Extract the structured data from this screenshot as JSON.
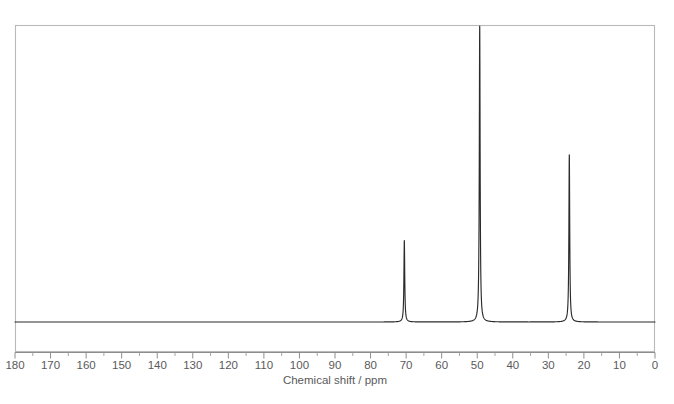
{
  "figure": {
    "title": "",
    "background_color": "#ffffff"
  },
  "chart_data": {
    "type": "line",
    "title": "",
    "subtitle": "",
    "xlabel": "Chemical shift / ppm",
    "ylabel": "",
    "xlim": [
      180,
      0
    ],
    "x_axis_reversed": true,
    "grid": false,
    "legend": null,
    "annotations": [],
    "x_major_ticks": [
      180,
      170,
      160,
      150,
      140,
      130,
      120,
      110,
      100,
      90,
      80,
      70,
      60,
      50,
      40,
      30,
      20,
      10,
      0
    ],
    "x_tick_labels": [
      "180",
      "170",
      "160",
      "150",
      "140",
      "130",
      "120",
      "110",
      "100",
      "90",
      "80",
      "70",
      "60",
      "50",
      "40",
      "30",
      "20",
      "10",
      "0"
    ],
    "x_minor_tick_interval": 5,
    "y_axis_visible": false,
    "ylim": [
      0,
      100
    ],
    "series": [
      {
        "name": "13C NMR spectrum",
        "color": "#2b2b2b",
        "baseline": 0,
        "peaks": [
          {
            "shift_ppm": 70.5,
            "relative_height": 27.5,
            "width_ppm": 0.55
          },
          {
            "shift_ppm": 49.3,
            "relative_height": 100.0,
            "width_ppm": 0.55
          },
          {
            "shift_ppm": 24.1,
            "relative_height": 56.5,
            "width_ppm": 0.55
          }
        ]
      }
    ]
  },
  "styles": {
    "frame_color": "#b9b9b9",
    "axis_color": "#8d8d8d",
    "trace_color": "#2b2b2b",
    "text_color": "#5a5a5a"
  }
}
